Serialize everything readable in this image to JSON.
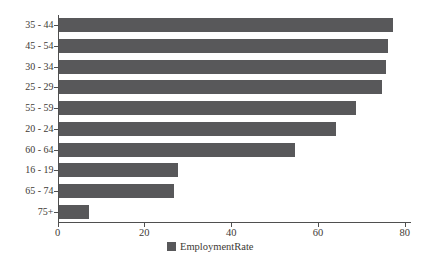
{
  "chart_data": {
    "type": "bar",
    "orientation": "horizontal",
    "title": "",
    "xlabel": "",
    "ylabel": "",
    "categories": [
      "35 - 44",
      "45 - 54",
      "30 - 34",
      "25 - 29",
      "55 - 59",
      "20 - 24",
      "60 - 64",
      "16 - 19",
      "65 - 74",
      "75+"
    ],
    "values": [
      77,
      76,
      75.5,
      74.5,
      68.5,
      64,
      54.5,
      27.5,
      26.5,
      7
    ],
    "xlim": [
      0,
      80
    ],
    "x_ticks": [
      0,
      20,
      40,
      60,
      80
    ],
    "grid": "off",
    "legend": {
      "label": "EmploymentRate",
      "position": "bottom-center"
    },
    "colors": {
      "bar": "#58585a",
      "axis": "#4f4f4f",
      "text": "#3e3a35",
      "background": "#ffffff"
    }
  }
}
